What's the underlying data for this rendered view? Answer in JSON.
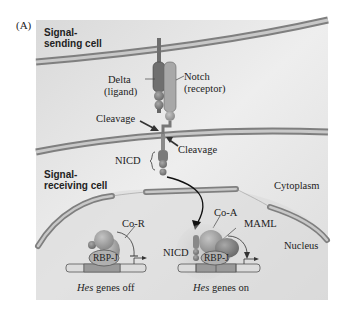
{
  "panel_label": "(A)",
  "cells": {
    "sending": {
      "line1": "Signal-",
      "line2": "sending cell"
    },
    "receiving": {
      "line1": "Signal-",
      "line2": "receiving cell"
    }
  },
  "labels": {
    "delta": "Delta",
    "delta_sub": "(ligand)",
    "notch": "Notch",
    "notch_sub": "(receptor)",
    "cleavage_left": "Cleavage",
    "cleavage_right": "Cleavage",
    "nicd_membrane": "NICD",
    "cytoplasm": "Cytoplasm",
    "nucleus": "Nucleus",
    "co_r": "Co-R",
    "rbp_off": "RBP-J",
    "co_a": "Co-A",
    "maml": "MAML",
    "nicd_nucleus": "NICD",
    "rbp_on": "RBP-J"
  },
  "captions": {
    "off_gene": "Hes",
    "off_rest": " genes off",
    "on_gene": "Hes",
    "on_rest": " genes on"
  },
  "colors": {
    "background_panel": "#e3e3e3",
    "membrane_outer": "#8a8a8a",
    "membrane_inner": "#c8c8c8",
    "delta": "#6f6f6f",
    "notch": "#a9a9a9",
    "protein": "#9a9a9a",
    "dna": "#d6d6d6"
  }
}
